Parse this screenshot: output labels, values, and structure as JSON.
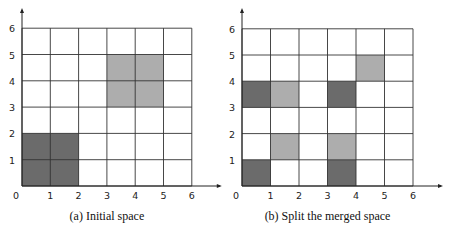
{
  "colors": {
    "dark": "#6b6b6b",
    "light": "#adadad",
    "grid": "#333333",
    "axis": "#222222"
  },
  "panels": [
    {
      "id": "a",
      "caption": "(a) Initial space",
      "origin_x": 22,
      "origin_y": 186,
      "cell_w": 28.3,
      "cell_h": 26.3,
      "cells": [
        {
          "x": 0,
          "y": 0,
          "w": 2,
          "h": 2,
          "shade": "dark"
        },
        {
          "x": 3,
          "y": 3,
          "w": 2,
          "h": 2,
          "shade": "light"
        }
      ]
    },
    {
      "id": "b",
      "caption": "(b) Split the merged space",
      "origin_x": 242,
      "origin_y": 186,
      "cell_w": 28.5,
      "cell_h": 26.2,
      "cells": [
        {
          "x": 0,
          "y": 0,
          "w": 1,
          "h": 1,
          "shade": "dark"
        },
        {
          "x": 3,
          "y": 0,
          "w": 1,
          "h": 1,
          "shade": "dark"
        },
        {
          "x": 1,
          "y": 1,
          "w": 1,
          "h": 1,
          "shade": "light"
        },
        {
          "x": 3,
          "y": 1,
          "w": 1,
          "h": 1,
          "shade": "light"
        },
        {
          "x": 0,
          "y": 3,
          "w": 1,
          "h": 1,
          "shade": "dark"
        },
        {
          "x": 1,
          "y": 3,
          "w": 1,
          "h": 1,
          "shade": "light"
        },
        {
          "x": 3,
          "y": 3,
          "w": 1,
          "h": 1,
          "shade": "dark"
        },
        {
          "x": 4,
          "y": 4,
          "w": 1,
          "h": 1,
          "shade": "light"
        }
      ]
    }
  ],
  "axis_ticks": [
    "0",
    "1",
    "2",
    "3",
    "4",
    "5",
    "6"
  ]
}
